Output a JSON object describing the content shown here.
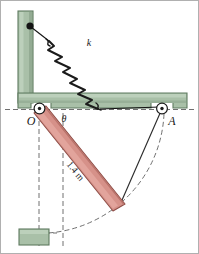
{
  "figure": {
    "labels": {
      "pivot_o": "O",
      "pivot_a": "A",
      "spring_constant": "k",
      "angle": "θ",
      "bar_length": "1.4 m"
    },
    "colors": {
      "bracket_fill": "#a9c0a8",
      "bracket_edge": "#5f7a60",
      "bracket_shade": "#93ab93",
      "bar_fill": "#d69189",
      "bar_edge": "#8f4f48",
      "bar_highlight": "#e6b0a9",
      "line": "#1a1a1a",
      "dashed": "#6f6f6f",
      "background": "#ffffff",
      "border": "#b0b0b0",
      "block_fill": "#a9c0a8"
    },
    "geometry": {
      "pivot_o": [
        38,
        108
      ],
      "pivot_a": [
        161,
        108
      ],
      "bar_end": [
        118,
        206
      ],
      "anchor_wall": [
        28,
        24
      ],
      "ground_y": 108,
      "bar_length_px": 125
    },
    "elements": [
      {
        "name": "vertical-wall-bracket",
        "type": "structure"
      },
      {
        "name": "horizontal-ledge-bracket",
        "type": "structure"
      },
      {
        "name": "spring",
        "type": "spring",
        "coils": 6
      },
      {
        "name": "cable-upper",
        "type": "line"
      },
      {
        "name": "cable-lower",
        "type": "line"
      },
      {
        "name": "pivot-o",
        "type": "pin-joint"
      },
      {
        "name": "pivot-a",
        "type": "pin-joint"
      },
      {
        "name": "rotating-bar",
        "type": "bar"
      },
      {
        "name": "tie-line-a-to-bar",
        "type": "line"
      },
      {
        "name": "swing-arc",
        "type": "dashed-arc"
      },
      {
        "name": "vertical-reference-left",
        "type": "dashed-line"
      },
      {
        "name": "vertical-reference-right",
        "type": "dashed-line"
      },
      {
        "name": "ground-reference",
        "type": "dashed-line"
      },
      {
        "name": "base-block",
        "type": "block"
      }
    ]
  }
}
